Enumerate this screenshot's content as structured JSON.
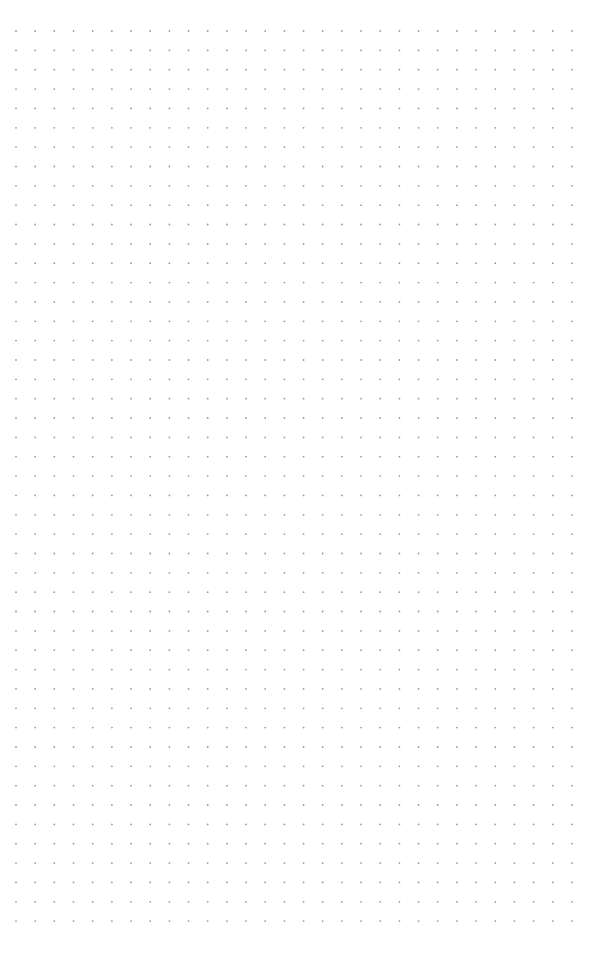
{
  "page": {
    "type": "dot-grid-paper",
    "background": "#ffffff",
    "dot_color": "#9a9a9a"
  },
  "grid": {
    "columns": 30,
    "rows": 47,
    "origin_x": 16,
    "origin_y": 31,
    "spacing_x": 19.17,
    "spacing_y": 19.35,
    "dot_radius": 0.9
  }
}
